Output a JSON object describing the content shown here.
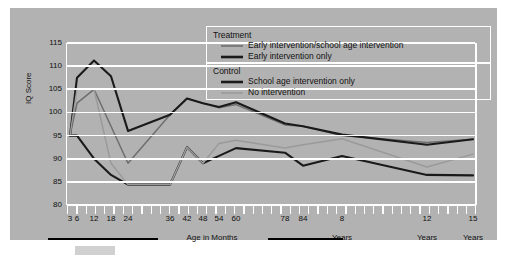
{
  "axes": {
    "ylabel": "IQ Score",
    "yticks": [
      115,
      110,
      105,
      100,
      95,
      90,
      85,
      80
    ],
    "ylim": [
      80,
      115
    ],
    "xlabels_top": [
      "3",
      "6",
      "12",
      "18",
      "24",
      "36",
      "42",
      "48",
      "54",
      "60",
      "78",
      "84",
      "8",
      "12",
      "15"
    ],
    "xlabels_bottom": [
      "",
      "",
      "",
      "",
      "",
      "",
      "",
      "",
      "",
      "",
      "",
      "",
      "Years",
      "Years",
      "Years"
    ],
    "group_label_months": "Age in Months"
  },
  "legend": {
    "group1_title": "Treatment",
    "group2_title": "Control",
    "items": [
      {
        "label": "Early intervention/school age intervention",
        "color": "#6e6e6e",
        "width": 1.6
      },
      {
        "label": "Early intervention only",
        "color": "#1a1a1a",
        "width": 2.4
      },
      {
        "label": "School age intervention only",
        "color": "#1a1a1a",
        "width": 2.4
      },
      {
        "label": "No intervention",
        "color": "#9a9a9a",
        "width": 1.6
      }
    ]
  },
  "colors": {
    "panel": "#b2b2b2",
    "grid": "#ffffff",
    "text": "#111111",
    "treatment_early_school": "#6e6e6e",
    "treatment_early_only": "#1a1a1a",
    "control_school_only": "#1a1a1a",
    "control_none": "#9a9a9a"
  },
  "chart_data": {
    "type": "line",
    "title": "",
    "xlabel": "Age in Months / Years",
    "ylabel": "IQ Score",
    "ylim": [
      80,
      115
    ],
    "grid": true,
    "legend_position": "top-right",
    "x": [
      3,
      6,
      12,
      18,
      24,
      36,
      42,
      48,
      54,
      60,
      78,
      84,
      96,
      144,
      180
    ],
    "x_tick_labels": [
      "3",
      "6",
      "12",
      "18",
      "24",
      "36",
      "42",
      "48",
      "54",
      "60",
      "78",
      "84",
      "8 Years",
      "12 Years",
      "15 Years"
    ],
    "series": [
      {
        "name": "Early intervention/school age intervention",
        "group": "Treatment",
        "color": "#6e6e6e",
        "values": [
          95.0,
          102.0,
          105.0,
          97.0,
          89.0,
          99.5,
          103.0,
          102.0,
          101.0,
          101.7,
          97.3,
          97.0,
          95.0,
          93.5,
          94.2
        ]
      },
      {
        "name": "Early intervention only",
        "group": "Treatment",
        "color": "#1a1a1a",
        "values": [
          95.0,
          107.5,
          111.2,
          107.8,
          96.0,
          99.5,
          103.0,
          102.0,
          101.2,
          102.2,
          97.6,
          97.0,
          95.2,
          93.0,
          94.2
        ]
      },
      {
        "name": "School age intervention only",
        "group": "Control",
        "color": "#1a1a1a",
        "values": [
          95.0,
          95.0,
          90.0,
          86.5,
          84.4,
          84.4,
          92.5,
          89.0,
          90.6,
          92.3,
          91.3,
          88.5,
          90.6,
          86.5,
          86.4
        ]
      },
      {
        "name": "No intervention",
        "group": "Control",
        "color": "#9a9a9a",
        "values": [
          95.0,
          105.0,
          105.0,
          89.0,
          84.4,
          84.4,
          92.5,
          89.0,
          93.3,
          94.0,
          92.3,
          93.0,
          94.3,
          88.2,
          91.0
        ]
      }
    ]
  }
}
